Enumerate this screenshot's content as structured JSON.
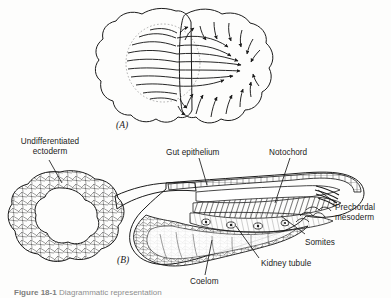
{
  "figure": {
    "panels": [
      {
        "mark": "(A)",
        "name": "surface-view-gastrulation"
      },
      {
        "mark": "(B)",
        "name": "sagittal-section-embryo"
      }
    ],
    "caption": {
      "prefix": "Figure 18-1",
      "text": "Diagrammatic representation"
    }
  },
  "labels": {
    "undifferentiated_ectoderm": "Undifferentiated\nectoderm",
    "undifferentiated_ectoderm_line1": "Undifferentiated",
    "undifferentiated_ectoderm_line2": "ectoderm",
    "gut_epithelium": "Gut epithelium",
    "notochord": "Notochord",
    "prechordal_mesoderm_line1": "Prechordal",
    "prechordal_mesoderm_line2": "mesoderm",
    "somites": "Somites",
    "kidney_tubule": "Kidney tubule",
    "coelom": "Coelom"
  },
  "colors": {
    "ink": "#1b1b1b",
    "paper": "#fdfdfc",
    "dashed_guide": "#9a9a9a",
    "shade_dark": "#6e6e6e",
    "shade_light": "#c9c9c9",
    "caption_gray": "#8e8e8e"
  }
}
